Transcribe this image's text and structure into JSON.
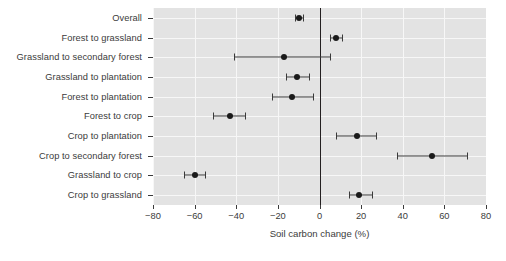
{
  "chart_data": {
    "type": "scatter",
    "orientation": "horizontal",
    "title": "",
    "xlabel": "Soil carbon change (%)",
    "ylabel": "",
    "xlim": [
      -80,
      80
    ],
    "xticks": [
      -80,
      -60,
      -40,
      -20,
      0,
      20,
      40,
      60,
      80
    ],
    "xtick_labels": [
      "−80",
      "−60",
      "−40",
      "−20",
      "0",
      "20",
      "40",
      "60",
      "80"
    ],
    "grid": true,
    "reference_line": 0,
    "legend": "none",
    "categories": [
      "Overall",
      "Forest to grassland",
      "Grassland to secondary forest",
      "Grassland to plantation",
      "Forest to plantation",
      "Forest to crop",
      "Crop to plantation",
      "Crop to secondary forest",
      "Grassland to crop",
      "Crop to grassland"
    ],
    "values": [
      -10,
      8,
      -17,
      -11,
      -13,
      -43,
      18,
      54,
      -60,
      19
    ],
    "ci_low": [
      -12,
      5,
      -41,
      -16,
      -23,
      -51,
      8,
      37,
      -65,
      14
    ],
    "ci_high": [
      -8,
      11,
      5,
      -5,
      -3,
      -36,
      27,
      71,
      -55,
      25
    ],
    "point_color": "#1a1a1a",
    "error_bar_color": "#3a3a3a",
    "panel_color": "#e3e3e3",
    "grid_color": "#f7f7f7",
    "zero_line_color": "#231f20",
    "background_color": "#ffffff"
  }
}
